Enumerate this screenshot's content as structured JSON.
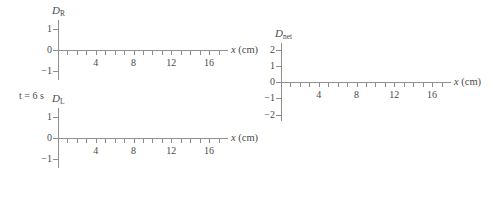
{
  "figure": {
    "time_label": "t = 6 s",
    "axis_color": "#8e8e8e",
    "text_color": "#4a4a4a",
    "background": "#ffffff"
  },
  "chart_data": [
    {
      "id": "D_R",
      "type": "line",
      "title": "",
      "series_symbol": "D",
      "series_subscript": "R",
      "ylabel": "D_R",
      "xlabel": "x (cm)",
      "xlabel_var": "x",
      "xlabel_unit": "(cm)",
      "x": [],
      "values": [],
      "xlim": [
        0,
        18
      ],
      "ylim": [
        -1.4,
        1.4
      ],
      "xticks": [
        1,
        2,
        3,
        4,
        5,
        6,
        7,
        8,
        9,
        10,
        11,
        12,
        13,
        14,
        15,
        16,
        17
      ],
      "xtick_labels": [
        {
          "value": 4,
          "label": "4"
        },
        {
          "value": 8,
          "label": "8"
        },
        {
          "value": 12,
          "label": "12"
        },
        {
          "value": 16,
          "label": "16"
        }
      ],
      "yticks": [
        -1,
        0,
        1
      ],
      "ytick_labels": [
        {
          "value": 1,
          "label": "1"
        },
        {
          "value": 0,
          "label": "0"
        },
        {
          "value": -1,
          "label": "−1"
        }
      ],
      "grid": false,
      "legend": false,
      "note": "empty axes, no data plotted"
    },
    {
      "id": "D_L",
      "type": "line",
      "title": "",
      "series_symbol": "D",
      "series_subscript": "L",
      "ylabel": "D_L",
      "xlabel": "x (cm)",
      "xlabel_var": "x",
      "xlabel_unit": "(cm)",
      "x": [],
      "values": [],
      "xlim": [
        0,
        18
      ],
      "ylim": [
        -1.4,
        1.4
      ],
      "xticks": [
        1,
        2,
        3,
        4,
        5,
        6,
        7,
        8,
        9,
        10,
        11,
        12,
        13,
        14,
        15,
        16,
        17
      ],
      "xtick_labels": [
        {
          "value": 4,
          "label": "4"
        },
        {
          "value": 8,
          "label": "8"
        },
        {
          "value": 12,
          "label": "12"
        },
        {
          "value": 16,
          "label": "16"
        }
      ],
      "yticks": [
        -1,
        0,
        1
      ],
      "ytick_labels": [
        {
          "value": 1,
          "label": "1"
        },
        {
          "value": 0,
          "label": "0"
        },
        {
          "value": -1,
          "label": "−1"
        }
      ],
      "grid": false,
      "legend": false,
      "note": "empty axes, no data plotted"
    },
    {
      "id": "D_net",
      "type": "line",
      "title": "",
      "series_symbol": "D",
      "series_subscript": "net",
      "ylabel": "D_net",
      "xlabel": "x (cm)",
      "xlabel_var": "x",
      "xlabel_unit": "(cm)",
      "x": [],
      "values": [],
      "xlim": [
        0,
        18
      ],
      "ylim": [
        -2.4,
        2.4
      ],
      "xticks": [
        1,
        2,
        3,
        4,
        5,
        6,
        7,
        8,
        9,
        10,
        11,
        12,
        13,
        14,
        15,
        16,
        17
      ],
      "xtick_labels": [
        {
          "value": 4,
          "label": "4"
        },
        {
          "value": 8,
          "label": "8"
        },
        {
          "value": 12,
          "label": "12"
        },
        {
          "value": 16,
          "label": "16"
        }
      ],
      "yticks": [
        -2,
        -1,
        0,
        1,
        2
      ],
      "ytick_labels": [
        {
          "value": 2,
          "label": "2"
        },
        {
          "value": 1,
          "label": "1"
        },
        {
          "value": 0,
          "label": "0"
        },
        {
          "value": -1,
          "label": "−1"
        },
        {
          "value": -2,
          "label": "−2"
        }
      ],
      "grid": false,
      "legend": false,
      "note": "empty axes, no data plotted"
    }
  ]
}
